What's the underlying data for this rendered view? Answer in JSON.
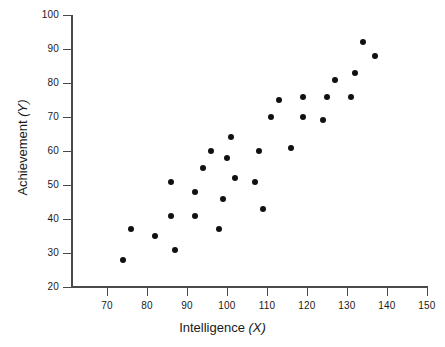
{
  "chart_data": {
    "type": "scatter",
    "title": "",
    "xlabel": "Intelligence (X)",
    "ylabel": "Achievement (Y)",
    "xlabel_text": "Intelligence",
    "xlabel_var": "(X)",
    "ylabel_text": "Achievement",
    "ylabel_var": "(Y)",
    "xlim": [
      70,
      150
    ],
    "ylim": [
      20,
      100
    ],
    "xticks": [
      70,
      80,
      90,
      100,
      110,
      120,
      130,
      140,
      150
    ],
    "yticks": [
      20,
      30,
      40,
      50,
      60,
      70,
      80,
      90,
      100
    ],
    "grid": false,
    "legend": false,
    "marker_color": "#111111",
    "axis_color": "#4a4a4a",
    "background": "#ffffff",
    "points": [
      {
        "x": 74,
        "y": 28
      },
      {
        "x": 76,
        "y": 37
      },
      {
        "x": 82,
        "y": 35
      },
      {
        "x": 86,
        "y": 41
      },
      {
        "x": 86,
        "y": 51
      },
      {
        "x": 87,
        "y": 31
      },
      {
        "x": 92,
        "y": 41
      },
      {
        "x": 92,
        "y": 48
      },
      {
        "x": 94,
        "y": 55
      },
      {
        "x": 96,
        "y": 60
      },
      {
        "x": 98,
        "y": 37
      },
      {
        "x": 99,
        "y": 46
      },
      {
        "x": 100,
        "y": 58
      },
      {
        "x": 101,
        "y": 64
      },
      {
        "x": 102,
        "y": 52
      },
      {
        "x": 107,
        "y": 51
      },
      {
        "x": 108,
        "y": 60
      },
      {
        "x": 109,
        "y": 43
      },
      {
        "x": 111,
        "y": 70
      },
      {
        "x": 113,
        "y": 75
      },
      {
        "x": 116,
        "y": 61
      },
      {
        "x": 119,
        "y": 70
      },
      {
        "x": 119,
        "y": 76
      },
      {
        "x": 124,
        "y": 69
      },
      {
        "x": 125,
        "y": 76
      },
      {
        "x": 127,
        "y": 81
      },
      {
        "x": 131,
        "y": 76
      },
      {
        "x": 132,
        "y": 83
      },
      {
        "x": 134,
        "y": 92
      },
      {
        "x": 137,
        "y": 88
      }
    ]
  }
}
